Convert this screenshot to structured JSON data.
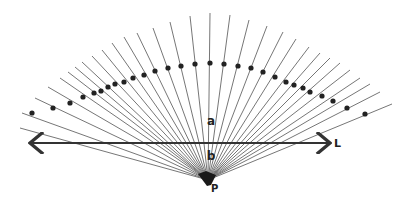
{
  "diagram": {
    "colors": {
      "rays": "#666666",
      "dots": "#222222",
      "line_L": "#333333",
      "labels": "#222222"
    },
    "point_P": {
      "label": "P",
      "x": 208,
      "y": 180
    },
    "line_L": {
      "label": "L",
      "x1": 30,
      "x2": 330,
      "y": 143,
      "arrows": "both"
    },
    "label_a": {
      "text": "a",
      "x": 211,
      "y": 125
    },
    "label_b": {
      "text": "b",
      "x": 211,
      "y": 160
    },
    "rays": [
      {
        "end": [
          20,
          128
        ],
        "dot": null
      },
      {
        "end": [
          22,
          113
        ],
        "dot": [
          32,
          113
        ]
      },
      {
        "end": [
          35,
          98
        ],
        "dot": [
          53,
          108
        ]
      },
      {
        "end": [
          48,
          87
        ],
        "dot": [
          70,
          103
        ]
      },
      {
        "end": [
          60,
          78
        ],
        "dot": [
          83,
          97
        ]
      },
      {
        "end": [
          68,
          72
        ],
        "dot": [
          94,
          93
        ]
      },
      {
        "end": [
          75,
          67
        ],
        "dot": [
          101,
          91
        ]
      },
      {
        "end": [
          82,
          62
        ],
        "dot": [
          108,
          87
        ]
      },
      {
        "end": [
          92,
          56
        ],
        "dot": [
          115,
          84
        ]
      },
      {
        "end": [
          102,
          50
        ],
        "dot": [
          124,
          82
        ]
      },
      {
        "end": [
          112,
          43
        ],
        "dot": [
          133,
          78
        ]
      },
      {
        "end": [
          124,
          37
        ],
        "dot": [
          144,
          75
        ]
      },
      {
        "end": [
          137,
          33
        ],
        "dot": [
          155,
          71
        ]
      },
      {
        "end": [
          153,
          28
        ],
        "dot": [
          168,
          68
        ]
      },
      {
        "end": [
          170,
          22
        ],
        "dot": [
          181,
          66
        ]
      },
      {
        "end": [
          190,
          16
        ],
        "dot": [
          195,
          64
        ]
      },
      {
        "end": [
          210,
          13
        ],
        "dot": [
          210,
          63
        ]
      },
      {
        "end": [
          230,
          15
        ],
        "dot": [
          224,
          64
        ]
      },
      {
        "end": [
          249,
          20
        ],
        "dot": [
          238,
          66
        ]
      },
      {
        "end": [
          267,
          26
        ],
        "dot": [
          251,
          68
        ]
      },
      {
        "end": [
          283,
          32
        ],
        "dot": [
          263,
          72
        ]
      },
      {
        "end": [
          296,
          39
        ],
        "dot": [
          275,
          77
        ]
      },
      {
        "end": [
          309,
          47
        ],
        "dot": [
          286,
          82
        ]
      },
      {
        "end": [
          320,
          53
        ],
        "dot": [
          294,
          85
        ]
      },
      {
        "end": [
          330,
          58
        ],
        "dot": [
          303,
          88
        ]
      },
      {
        "end": [
          340,
          63
        ],
        "dot": [
          310,
          92
        ]
      },
      {
        "end": [
          350,
          70
        ],
        "dot": [
          322,
          96
        ]
      },
      {
        "end": [
          360,
          78
        ],
        "dot": [
          333,
          101
        ]
      },
      {
        "end": [
          370,
          84
        ],
        "dot": [
          347,
          108
        ]
      },
      {
        "end": [
          380,
          92
        ],
        "dot": [
          365,
          114
        ]
      },
      {
        "end": [
          392,
          104
        ],
        "dot": null
      }
    ]
  }
}
